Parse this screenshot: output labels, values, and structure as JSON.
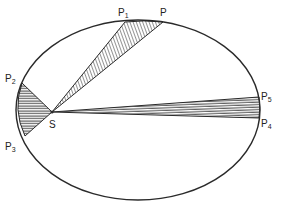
{
  "diagram": {
    "ink_color": "#2a2a2a",
    "ellipse": {
      "cx": 138,
      "cy": 110,
      "rx": 122,
      "ry": 90
    },
    "focus": {
      "label": "S",
      "x": 52,
      "y": 112
    },
    "points": [
      {
        "id": "P",
        "base": "P",
        "sub": "",
        "x": 163,
        "y": 22
      },
      {
        "id": "P1",
        "base": "P",
        "sub": "1",
        "x": 125,
        "y": 22
      },
      {
        "id": "P2",
        "base": "P",
        "sub": "2",
        "x": 22,
        "y": 83
      },
      {
        "id": "P3",
        "base": "P",
        "sub": "3",
        "x": 25,
        "y": 136
      },
      {
        "id": "P4",
        "base": "P",
        "sub": "4",
        "x": 259,
        "y": 118
      },
      {
        "id": "P5",
        "base": "P",
        "sub": "5",
        "x": 259,
        "y": 97
      }
    ],
    "sectors": [
      {
        "name": "sector-P1-P",
        "from": "P1",
        "to": "P"
      },
      {
        "name": "sector-P2-P3",
        "from": "P2",
        "to": "P3"
      },
      {
        "name": "sector-P5-P4",
        "from": "P5",
        "to": "P4"
      }
    ],
    "labels": {
      "P": {
        "text": "P",
        "sub": "",
        "x": 160,
        "y": 16
      },
      "P1": {
        "text": "P",
        "sub": "1",
        "x": 118,
        "y": 16
      },
      "P2": {
        "text": "P",
        "sub": "2",
        "x": 5,
        "y": 82
      },
      "P3": {
        "text": "P",
        "sub": "3",
        "x": 5,
        "y": 150
      },
      "P4": {
        "text": "P",
        "sub": "4",
        "x": 261,
        "y": 127
      },
      "P5": {
        "text": "P",
        "sub": "5",
        "x": 261,
        "y": 100
      },
      "S": {
        "text": "S",
        "sub": "",
        "x": 49,
        "y": 128
      }
    }
  }
}
